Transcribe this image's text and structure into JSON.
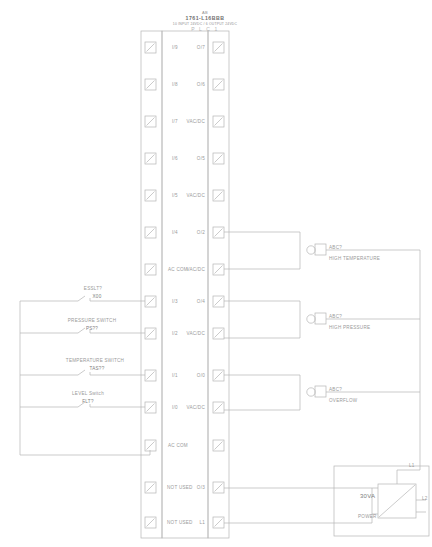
{
  "title_block": {
    "line1": "AB",
    "line2": "1761-L16BBB",
    "line3": "10 INPUT 24VDC / 6 OUTPUT 24VDC",
    "line4": "P L C 1"
  },
  "plc": {
    "left_terminals": [
      {
        "label": "I/9"
      },
      {
        "label": "I/8"
      },
      {
        "label": "I/7"
      },
      {
        "label": "I/6"
      },
      {
        "label": "I/5"
      },
      {
        "label": "I/4"
      },
      {
        "label": "AC COM"
      },
      {
        "label": "I/3"
      },
      {
        "label": "I/2"
      },
      {
        "label": "I/1"
      },
      {
        "label": "I/0"
      },
      {
        "label": "AC COM"
      },
      {
        "label": "NOT USED"
      },
      {
        "label": "NOT USED"
      }
    ],
    "right_terminals": [
      {
        "label": "O/7"
      },
      {
        "label": "O/6"
      },
      {
        "label": "VAC/DC"
      },
      {
        "label": "O/5"
      },
      {
        "label": "VAC/DC"
      },
      {
        "label": "O/2"
      },
      {
        "label": "VAC/DC"
      },
      {
        "label": "O/4"
      },
      {
        "label": "VAC/DC"
      },
      {
        "label": "O/0"
      },
      {
        "label": "VAC/DC"
      },
      {
        "label": ""
      },
      {
        "label": "O/3"
      },
      {
        "label": "L1"
      }
    ]
  },
  "field_devices": [
    {
      "name": "ESSLT?",
      "tag": "X00",
      "type": "contact"
    },
    {
      "name": "PRESSURE SWITCH",
      "tag": "PS??",
      "type": "contact"
    },
    {
      "name": "TEMPERATURE SWITCH",
      "tag": "TAS??",
      "type": "contact"
    },
    {
      "name": "LEVEL Switch",
      "tag": "FLT?",
      "type": "contact"
    }
  ],
  "annunciators": [
    {
      "tag": "ABC?",
      "description": "HIGH TEMPERATURE"
    },
    {
      "tag": "ABC?",
      "description": "HIGH PRESSURE"
    },
    {
      "tag": "ABC?",
      "description": "OVERFLOW"
    }
  ],
  "power_supply": {
    "rating": "30VA",
    "label": "POWER",
    "terminal_top": "L1",
    "terminal_bottom": "L2"
  },
  "colors": {
    "line": "#b0b0b0",
    "text": "#9a9a9a",
    "background": "#ffffff"
  }
}
